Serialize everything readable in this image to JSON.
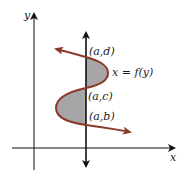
{
  "diagram": {
    "axes": {
      "x_label": "x",
      "y_label": "y"
    },
    "curve_label": "x = f(y)",
    "points": [
      {
        "id": "d",
        "label": "(a,d)"
      },
      {
        "id": "c",
        "label": "(a,c)"
      },
      {
        "id": "b",
        "label": "(a,b)"
      }
    ],
    "colors": {
      "curve": "#8b3a2a",
      "shade": "#a6a6a6",
      "axis": "#111111"
    }
  }
}
